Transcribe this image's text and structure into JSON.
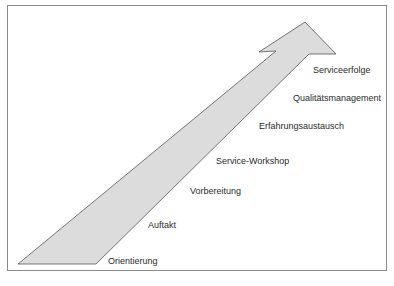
{
  "diagram": {
    "type": "rising-arrow-stages",
    "colors": {
      "frame_border": "#8a8a8a",
      "arrow_fill": "#dcdcdc",
      "arrow_stroke": "#555555",
      "text": "#2a2a2a"
    },
    "stages": [
      {
        "label": "Orientierung"
      },
      {
        "label": "Auftakt"
      },
      {
        "label": "Vorbereitung"
      },
      {
        "label": "Service-Workshop"
      },
      {
        "label": "Erfahrungsaustausch"
      },
      {
        "label": "Qualitätsmanagement"
      },
      {
        "label": "Serviceerfolge"
      }
    ]
  }
}
